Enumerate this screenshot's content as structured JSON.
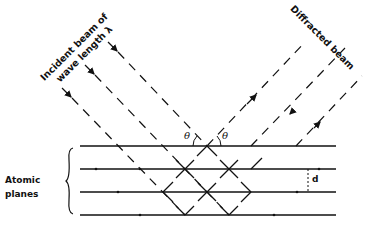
{
  "labels": {
    "incident_line1": "Incident beam of",
    "incident_line2": "wave length λ",
    "diffracted": "Diffracted beam",
    "atomic_line1": "Atomic",
    "atomic_line2": "planes",
    "theta_left": "θ",
    "theta_right": "θ",
    "spacing": "d"
  },
  "colors": {
    "ink": "#111111",
    "background": "#ffffff"
  },
  "planes": [
    146,
    169,
    192,
    215
  ]
}
